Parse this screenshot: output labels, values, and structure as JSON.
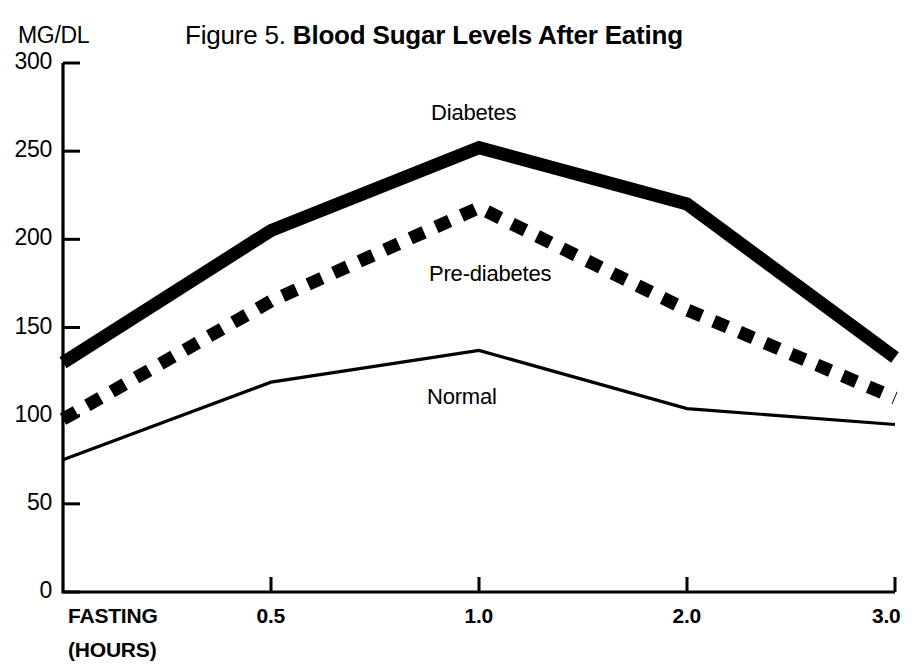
{
  "figure": {
    "unit_label": "MG/DL",
    "title_prefix": "Figure 5. ",
    "title_main": "Blood Sugar Levels After Eating"
  },
  "axis": {
    "x_first_tick_label": "FASTING",
    "x_unit_label": "(HOURS)",
    "y_ticks": [
      "300",
      "250",
      "200",
      "150",
      "100",
      "50",
      "0"
    ],
    "x_ticks": [
      "FASTING",
      "0.5",
      "1.0",
      "2.0",
      "3.0"
    ]
  },
  "series_labels": {
    "diabetes": "Diabetes",
    "prediabetes": "Pre-diabetes",
    "normal": "Normal"
  },
  "colors": {
    "ink": "#000000",
    "background": "#ffffff"
  },
  "chart_data": {
    "type": "line",
    "title": "Figure 5. Blood Sugar Levels After Eating",
    "xlabel": "(HOURS)",
    "ylabel": "MG/DL",
    "ylim": [
      0,
      300
    ],
    "ytick_values": [
      0,
      50,
      100,
      150,
      200,
      250,
      300
    ],
    "grid": false,
    "legend": "inline-annotations",
    "categories": [
      "FASTING",
      "0.5",
      "1.0",
      "2.0",
      "3.0"
    ],
    "series": [
      {
        "name": "Diabetes",
        "style": "thick-solid",
        "values": [
          130,
          205,
          252,
          220,
          133
        ]
      },
      {
        "name": "Pre-diabetes",
        "style": "thick-dashed",
        "values": [
          98,
          165,
          218,
          160,
          110
        ]
      },
      {
        "name": "Normal",
        "style": "thin-solid",
        "values": [
          75,
          119,
          137,
          104,
          95
        ]
      }
    ]
  }
}
